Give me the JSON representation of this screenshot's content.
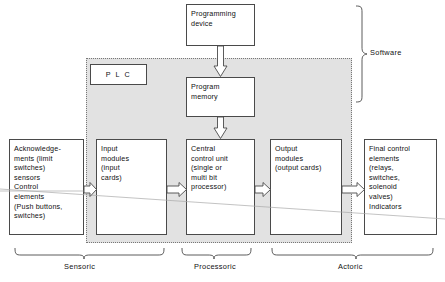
{
  "diagram": {
    "shaded_region_label": "PLC",
    "colors": {
      "shade": "#e2e2e2",
      "line": "#4a4a4a",
      "text": "#111111",
      "artifact": "#a9a9a9"
    }
  },
  "boxes": {
    "programming_device": "Programming\ndevice",
    "program_memory": "Program\nmemory",
    "plc": "P L C",
    "acknowledgements": "Acknowledge-\nments (limit\nswitches)\nsensors\nControl\nelements\n(Push buttons,\nswitches)",
    "input_modules": "Input\nmodules\n(input\ncards)",
    "central_control_unit": "Central\ncontrol unit\n(single or\nmulti bit\nprocessor)",
    "output_modules": "Output\nmodules\n(output cards)",
    "final_control_elements": "Final control\nelements\n(relays,\nswitches,\nsolenoid\nvalves)\nIndicators"
  },
  "captions": {
    "sensoric": "Sensoric",
    "processoric": "Processoric",
    "actoric": "Actoric",
    "software": "Software"
  },
  "connectors": [
    {
      "name": "progdev-to-progmem",
      "direction": "down"
    },
    {
      "name": "progmem-to-central",
      "direction": "down"
    },
    {
      "name": "ack-to-input",
      "direction": "right"
    },
    {
      "name": "input-to-central",
      "direction": "right"
    },
    {
      "name": "central-to-output",
      "direction": "right"
    },
    {
      "name": "output-to-final",
      "direction": "right"
    }
  ]
}
